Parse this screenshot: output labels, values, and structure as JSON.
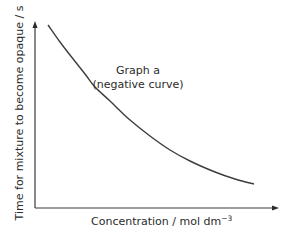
{
  "chart_data": {
    "type": "line",
    "title": "",
    "xlabel": "Concentration / mol dm⁻³",
    "xlabel_main": "Concentration / mol dm",
    "xlabel_sup": "−3",
    "ylabel": "Time for mixture to become opaque / s",
    "annotation": {
      "line1": "Graph a",
      "line2": "(negative curve)"
    },
    "grid": false,
    "legend": null,
    "ticks": false,
    "series": [
      {
        "name": "Graph a",
        "description": "decreasing (negative) curve",
        "points_px": [
          [
            48,
            25
          ],
          [
            60,
            42
          ],
          [
            70,
            55
          ],
          [
            85,
            74
          ],
          [
            95,
            87
          ],
          [
            110,
            101
          ],
          [
            130,
            120
          ],
          [
            150,
            136
          ],
          [
            170,
            150
          ],
          [
            190,
            161
          ],
          [
            215,
            172
          ],
          [
            235,
            179
          ],
          [
            254,
            184
          ]
        ]
      }
    ],
    "colors": {
      "axis": "#3a3a3a",
      "curve": "#3d3d3d",
      "text": "#2b2b2b"
    }
  }
}
